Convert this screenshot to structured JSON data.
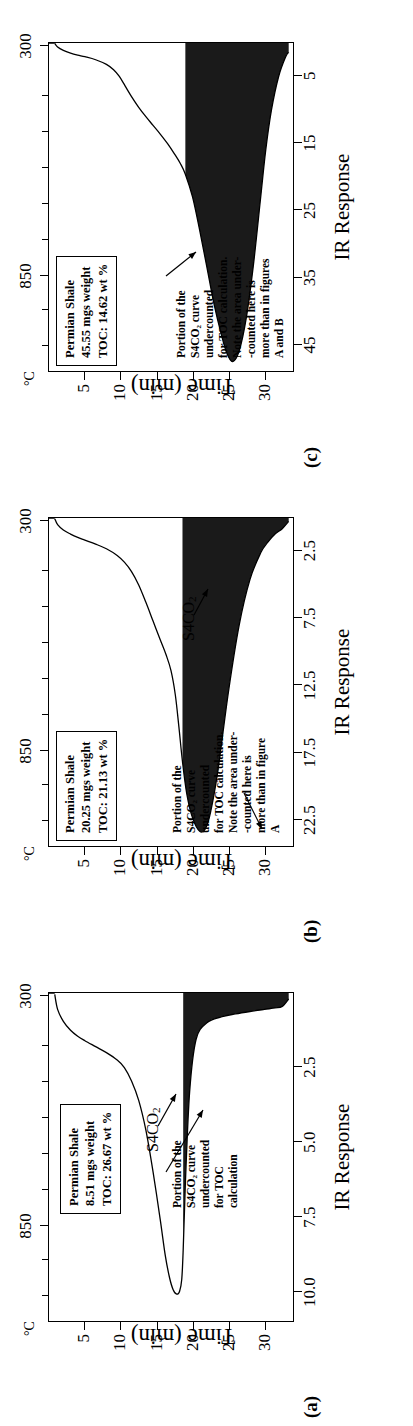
{
  "figure": {
    "axis_titles": {
      "x": "Time (min)",
      "y": "IR Response",
      "temperature_unit": "°C"
    },
    "temperature_labels": {
      "left": "300",
      "right": "850"
    },
    "series_label": "S4CO",
    "series_label_sub": "2",
    "colors": {
      "curve": "#000000",
      "fill": "#1a1a1a",
      "frame": "#000000"
    }
  },
  "panels": [
    {
      "id": "a",
      "letter": "(a)",
      "info": {
        "line1": "Permian Shale",
        "line2": "8.51 mgs weight",
        "line3": "TOC: 26.67 wt %"
      },
      "annotation": [
        "Portion of the",
        "S4CO₂ curve",
        "undercounted",
        "for TOC",
        "calculation"
      ],
      "ylabels": [
        "10.0",
        "7.5",
        "5.0",
        "2.5"
      ],
      "yvalues": [
        10.0,
        7.5,
        5.0,
        2.5
      ],
      "ylim": [
        0,
        11.0
      ],
      "xlabels": [
        "5",
        "10",
        "15",
        "20",
        "25",
        "30"
      ],
      "xvalues": [
        5,
        10,
        15,
        20,
        25,
        30
      ],
      "xlim": [
        0,
        34
      ]
    },
    {
      "id": "b",
      "letter": "(b)",
      "info": {
        "line1": "Permian Shale",
        "line2": "20.25 mgs weight",
        "line3": "TOC: 21.13 wt %"
      },
      "annotation": [
        "Portion of the",
        "S4CO₂ curve",
        "undercounted",
        "for TOC calculation.",
        "Note the area under-",
        "-counted here is",
        "more than in figure",
        "A"
      ],
      "ylabels": [
        "22.5",
        "17.5",
        "12.5",
        "7.5",
        "2.5"
      ],
      "yvalues": [
        22.5,
        17.5,
        12.5,
        7.5,
        2.5
      ],
      "ylim": [
        0,
        24.5
      ],
      "xlabels": [
        "5",
        "10",
        "15",
        "20",
        "25",
        "30"
      ],
      "xvalues": [
        5,
        10,
        15,
        20,
        25,
        30
      ],
      "xlim": [
        0,
        34
      ]
    },
    {
      "id": "c",
      "letter": "(c)",
      "info": {
        "line1": "Permian Shale",
        "line2": "45.55 mgs weight",
        "line3": "TOC: 14.62 wt %"
      },
      "annotation": [
        "Portion of the",
        "S4CO₂ curve",
        "undercounted",
        "for TOC calculation.",
        "Note the area under-",
        "-counted here is",
        "more than in figures",
        "A and B"
      ],
      "ylabels": [
        "45",
        "35",
        "25",
        "15",
        "5"
      ],
      "yvalues": [
        45,
        35,
        25,
        15,
        5
      ],
      "ylim": [
        0,
        49
      ],
      "xlabels": [
        "5",
        "10",
        "15",
        "20",
        "25",
        "30"
      ],
      "xvalues": [
        5,
        10,
        15,
        20,
        25,
        30
      ],
      "xlim": [
        0,
        34
      ]
    }
  ],
  "chart_data": {
    "type": "line",
    "xlabel": "Time (min)",
    "ylabel": "IR Response",
    "secondary_axis": {
      "label": "°C",
      "ticks": [
        300,
        850
      ]
    },
    "grid": false,
    "legend": "none",
    "panels": [
      {
        "id": "a",
        "ylim": [
          0,
          11.0
        ],
        "xlim": [
          0,
          34
        ],
        "fill_start_x": 18.6,
        "series": [
          {
            "name": "S4CO2",
            "x": [
              0.8,
              1.2,
              2.0,
              3.0,
              4.0,
              5.0,
              6.5,
              8.0,
              9.5,
              10.5,
              11.5,
              12.5,
              13.5,
              14.5,
              15.5,
              16.2,
              16.8,
              17.3,
              17.8,
              18.2,
              18.5,
              18.7,
              19.0,
              19.6,
              20.5,
              22.0,
              24.0,
              26.0,
              28.0,
              30.0,
              31.5,
              32.5,
              33.4
            ],
            "y": [
              0.05,
              0.55,
              0.95,
              1.25,
              1.45,
              1.6,
              1.8,
              2.0,
              2.25,
              2.5,
              2.95,
              3.6,
              4.6,
              6.0,
              7.6,
              8.8,
              9.55,
              9.95,
              10.1,
              10.0,
              9.6,
              8.6,
              6.4,
              3.3,
              1.55,
              1.0,
              0.8,
              0.7,
              0.62,
              0.55,
              0.5,
              0.45,
              0.2
            ]
          }
        ]
      },
      {
        "id": "b",
        "ylim": [
          0,
          24.5
        ],
        "xlim": [
          0,
          34
        ],
        "fill_start_x": 18.6,
        "series": [
          {
            "name": "S4CO2",
            "x": [
              0.8,
              1.2,
              2.0,
              3.0,
              4.0,
              5.0,
              6.5,
              8.0,
              9.5,
              10.5,
              11.5,
              12.5,
              13.5,
              14.5,
              15.5,
              16.3,
              17.0,
              17.6,
              18.1,
              18.6,
              19.2,
              20.0,
              21.0,
              21.8,
              22.5,
              23.5,
              25.0,
              26.5,
              28.0,
              29.5,
              30.5,
              31.5,
              32.5,
              33.4
            ],
            "y": [
              0.05,
              0.5,
              0.9,
              1.2,
              1.45,
              1.65,
              1.95,
              2.3,
              2.8,
              3.3,
              4.0,
              5.0,
              6.3,
              7.7,
              9.1,
              10.2,
              11.4,
              13.2,
              15.6,
              18.2,
              20.6,
              22.4,
              23.4,
              23.2,
              22.0,
              19.0,
              13.0,
              8.0,
              4.6,
              2.6,
              1.8,
              1.2,
              0.8,
              0.25
            ]
          }
        ]
      },
      {
        "id": "c",
        "ylim": [
          0,
          49
        ],
        "xlim": [
          0,
          34
        ],
        "fill_start_x": 18.6,
        "series": [
          {
            "name": "S4CO2",
            "x": [
              0.8,
              1.2,
              2.0,
              3.0,
              4.0,
              5.0,
              6.5,
              8.0,
              9.0,
              9.8,
              10.6,
              11.5,
              12.5,
              13.5,
              14.5,
              15.5,
              16.5,
              17.5,
              18.3,
              19.0,
              20.0,
              21.0,
              22.0,
              23.0,
              24.0,
              24.8,
              25.6,
              26.5,
              27.5,
              28.5,
              29.5,
              30.2,
              31.0,
              32.0,
              33.0,
              33.4
            ],
            "y": [
              0.05,
              0.6,
              1.1,
              1.5,
              1.8,
              2.05,
              2.5,
              3.2,
              4.0,
              5.0,
              6.4,
              8.0,
              9.6,
              11.0,
              12.3,
              13.6,
              15.0,
              16.6,
              18.0,
              19.6,
              23.0,
              28.0,
              33.5,
              39.0,
              43.5,
              46.4,
              47.6,
              46.0,
              41.0,
              33.0,
              23.0,
              16.0,
              10.0,
              5.0,
              2.0,
              1.4
            ]
          }
        ]
      }
    ]
  }
}
